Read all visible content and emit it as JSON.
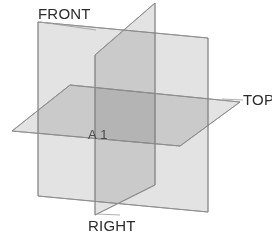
{
  "figure": {
    "background_color": "#ffffff",
    "width": 272,
    "height": 236
  },
  "labels": {
    "front": "FRONT",
    "top": "TOP",
    "right": "RIGHT",
    "center": "A 1"
  },
  "planes": [
    {
      "id": "front",
      "label": "FRONT",
      "fill": "#e3e3e3",
      "stroke": "#8d8d8d",
      "points": "38,22 208,38 208,212 38,196"
    },
    {
      "id": "right",
      "label": "RIGHT",
      "fill": "#e3e3e3",
      "stroke": "#8d8d8d",
      "points": "155,3 155,185 95,215 95,55"
    },
    {
      "id": "top",
      "label": "TOP",
      "fill": "#e3e3e3",
      "stroke": "#8d8d8d",
      "points": "12,131 70,85 240,102 180,146"
    }
  ],
  "colors": {
    "plane_fill": "#e3e3e3",
    "plane_stroke": "#8d8d8d",
    "overlap_double": "#d2d2d2",
    "overlap_triple": "#b8b8b8",
    "label_text": "#2b2b2b",
    "center_text": "#4a4a4a",
    "leader_line": "#9a9a9a"
  },
  "leaders": [
    {
      "id": "front-leader",
      "d": "M 40,22 L 96,30"
    },
    {
      "id": "top-leader",
      "d": "M 222,99 L 243,100"
    },
    {
      "id": "right-leader",
      "d": "M 97,214 L 120,215"
    }
  ]
}
